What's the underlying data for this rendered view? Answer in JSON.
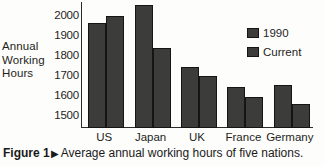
{
  "chart_data": {
    "type": "bar",
    "title": "",
    "xlabel": "",
    "ylabel": "Annual Working Hours",
    "ylabel_lines": [
      "Annual",
      "Working",
      "Hours"
    ],
    "categories": [
      "US",
      "Japan",
      "UK",
      "France",
      "Germany"
    ],
    "series": [
      {
        "name": "1990",
        "values": [
          1965,
          2057,
          1745,
          1645,
          1655
        ],
        "color": "#3c3c3a"
      },
      {
        "name": "Current",
        "values": [
          2000,
          1838,
          1698,
          1594,
          1560
        ],
        "color": "#3c3c3a"
      }
    ],
    "ylim": [
      1440,
      2070
    ],
    "yticks": [
      1500,
      1600,
      1700,
      1800,
      1900,
      2000
    ],
    "ytick_labels": [
      "1500",
      "1600",
      "1700",
      "1800",
      "1900",
      "2000"
    ],
    "grid": false,
    "legend_position": "top-right",
    "axis_color": "#2a2a28"
  },
  "legend": {
    "entries": [
      {
        "label": "1990"
      },
      {
        "label": "Current"
      }
    ]
  },
  "caption": {
    "label": "Figure 1",
    "marker": "▶",
    "text": "Average annual working hours of five nations."
  }
}
